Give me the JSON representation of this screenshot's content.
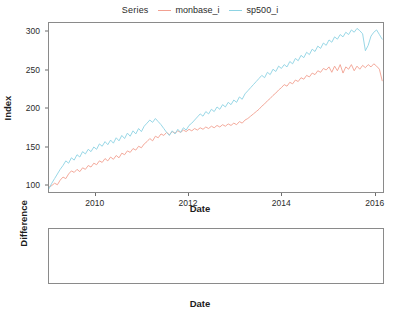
{
  "legend": {
    "title": "Series",
    "entries": [
      {
        "label": "monbase_i",
        "color": "#f2a091"
      },
      {
        "label": "sp500_i",
        "color": "#8dd3e3"
      }
    ]
  },
  "colors": {
    "monbase": "#f2a091",
    "sp500": "#8dd3e3",
    "difference": "#2b2b2b",
    "panel_border": "#8a8a8a",
    "text": "#2b2b2b",
    "background": "#ffffff"
  },
  "chart_data": [
    {
      "type": "line",
      "name": "index-panel",
      "title": "",
      "xlabel": "Date",
      "ylabel": "Index",
      "xlim": [
        2009.0,
        2016.2
      ],
      "ylim": [
        90,
        312
      ],
      "xticks": [
        2010,
        2012,
        2014,
        2016
      ],
      "yticks": [
        100,
        150,
        200,
        250,
        300
      ],
      "grid": false,
      "legend_position": "top-center",
      "x": [
        2009.0,
        2009.06,
        2009.12,
        2009.18,
        2009.24,
        2009.3,
        2009.36,
        2009.42,
        2009.48,
        2009.54,
        2009.6,
        2009.66,
        2009.72,
        2009.78,
        2009.84,
        2009.9,
        2009.96,
        2010.02,
        2010.08,
        2010.14,
        2010.2,
        2010.26,
        2010.32,
        2010.38,
        2010.44,
        2010.5,
        2010.56,
        2010.62,
        2010.68,
        2010.74,
        2010.8,
        2010.86,
        2010.92,
        2010.98,
        2011.04,
        2011.1,
        2011.16,
        2011.22,
        2011.28,
        2011.34,
        2011.4,
        2011.46,
        2011.52,
        2011.58,
        2011.64,
        2011.7,
        2011.76,
        2011.82,
        2011.88,
        2011.94,
        2012.0,
        2012.06,
        2012.12,
        2012.18,
        2012.24,
        2012.3,
        2012.36,
        2012.42,
        2012.48,
        2012.54,
        2012.6,
        2012.66,
        2012.72,
        2012.78,
        2012.84,
        2012.9,
        2012.96,
        2013.02,
        2013.08,
        2013.14,
        2013.2,
        2013.26,
        2013.32,
        2013.38,
        2013.44,
        2013.5,
        2013.56,
        2013.62,
        2013.68,
        2013.74,
        2013.8,
        2013.86,
        2013.92,
        2013.98,
        2014.04,
        2014.1,
        2014.16,
        2014.22,
        2014.28,
        2014.34,
        2014.4,
        2014.46,
        2014.52,
        2014.58,
        2014.64,
        2014.7,
        2014.76,
        2014.82,
        2014.88,
        2014.94,
        2015.0,
        2015.06,
        2015.12,
        2015.18,
        2015.24,
        2015.3,
        2015.36,
        2015.42,
        2015.48,
        2015.54,
        2015.6,
        2015.66,
        2015.72,
        2015.78,
        2015.84,
        2015.9,
        2015.96,
        2016.02,
        2016.08,
        2016.14
      ],
      "series": [
        {
          "name": "monbase_i",
          "color": "#f2a091",
          "values": [
            99,
            101,
            104,
            102,
            108,
            112,
            110,
            116,
            120,
            118,
            122,
            119,
            124,
            122,
            127,
            125,
            130,
            128,
            133,
            131,
            136,
            133,
            138,
            135,
            140,
            137,
            143,
            141,
            146,
            144,
            149,
            147,
            152,
            150,
            155,
            158,
            162,
            159,
            165,
            163,
            168,
            166,
            170,
            167,
            171,
            169,
            172,
            170,
            173,
            171,
            174,
            172,
            175,
            173,
            176,
            174,
            177,
            175,
            178,
            176,
            179,
            177,
            180,
            178,
            181,
            179,
            182,
            180,
            184,
            182,
            186,
            188,
            191,
            194,
            197,
            200,
            204,
            207,
            211,
            214,
            218,
            221,
            225,
            228,
            232,
            230,
            235,
            233,
            238,
            236,
            241,
            239,
            244,
            242,
            247,
            245,
            250,
            248,
            253,
            251,
            255,
            248,
            256,
            250,
            258,
            247,
            255,
            252,
            258,
            250,
            256,
            252,
            257,
            254,
            258,
            255,
            259,
            256,
            252,
            237
          ]
        },
        {
          "name": "sp500_i",
          "color": "#8dd3e3",
          "values": [
            97,
            104,
            110,
            116,
            122,
            127,
            133,
            130,
            137,
            134,
            141,
            138,
            145,
            142,
            148,
            145,
            151,
            148,
            155,
            152,
            158,
            154,
            160,
            156,
            163,
            159,
            166,
            162,
            169,
            165,
            172,
            168,
            175,
            171,
            178,
            182,
            186,
            183,
            188,
            184,
            180,
            175,
            170,
            166,
            172,
            168,
            174,
            170,
            176,
            173,
            179,
            182,
            186,
            190,
            194,
            191,
            197,
            194,
            200,
            197,
            203,
            200,
            206,
            203,
            209,
            206,
            212,
            209,
            216,
            213,
            220,
            224,
            228,
            232,
            236,
            240,
            244,
            241,
            248,
            245,
            252,
            249,
            256,
            253,
            258,
            255,
            262,
            259,
            266,
            263,
            270,
            267,
            274,
            271,
            278,
            275,
            282,
            279,
            286,
            283,
            290,
            287,
            294,
            291,
            297,
            294,
            300,
            297,
            303,
            300,
            305,
            302,
            298,
            276,
            283,
            295,
            300,
            303,
            297,
            291
          ]
        }
      ]
    },
    {
      "type": "line",
      "name": "difference-panel",
      "title": "",
      "xlabel": "Date",
      "ylabel": "Difference",
      "xlim": [
        2009.0,
        2016.2
      ],
      "ylim": [
        -8,
        66
      ],
      "xticks": [
        2010,
        2012,
        2014,
        2016
      ],
      "yticks": [
        0,
        20,
        40,
        60
      ],
      "grid": false,
      "series": [
        {
          "name": "Difference",
          "color": "#2b2b2b",
          "values": [
            -2,
            3,
            6,
            14,
            14,
            15,
            23,
            14,
            17,
            16,
            19,
            19,
            21,
            20,
            21,
            20,
            21,
            20,
            22,
            21,
            22,
            21,
            22,
            21,
            23,
            22,
            23,
            21,
            23,
            21,
            23,
            21,
            23,
            21,
            23,
            24,
            24,
            24,
            23,
            21,
            12,
            9,
            0,
            -1,
            1,
            -1,
            2,
            0,
            3,
            2,
            5,
            10,
            11,
            17,
            18,
            17,
            20,
            19,
            22,
            21,
            24,
            23,
            26,
            25,
            28,
            27,
            30,
            29,
            32,
            31,
            34,
            36,
            37,
            38,
            39,
            40,
            40,
            34,
            37,
            31,
            34,
            28,
            31,
            25,
            26,
            25,
            27,
            26,
            28,
            27,
            29,
            28,
            30,
            29,
            31,
            30,
            32,
            31,
            33,
            32,
            35,
            39,
            38,
            41,
            39,
            47,
            45,
            45,
            45,
            50,
            49,
            50,
            41,
            22,
            25,
            40,
            41,
            47,
            45,
            54
          ]
        }
      ]
    }
  ]
}
